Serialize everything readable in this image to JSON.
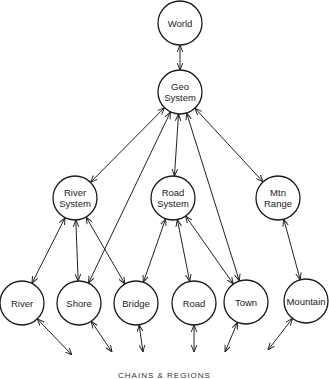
{
  "diagram": {
    "type": "hierarchy",
    "nodes": [
      {
        "id": "world",
        "lines": [
          "World"
        ],
        "x": 180,
        "y": 23
      },
      {
        "id": "geo",
        "lines": [
          "Geo",
          "System"
        ],
        "x": 180,
        "y": 92
      },
      {
        "id": "riversys",
        "lines": [
          "River",
          "System"
        ],
        "x": 75,
        "y": 198
      },
      {
        "id": "roadsys",
        "lines": [
          "Road",
          "System"
        ],
        "x": 173,
        "y": 198
      },
      {
        "id": "mtn",
        "lines": [
          "Mtn",
          "Range"
        ],
        "x": 278,
        "y": 198
      },
      {
        "id": "river",
        "lines": [
          "River"
        ],
        "x": 22,
        "y": 303
      },
      {
        "id": "shore",
        "lines": [
          "Shore"
        ],
        "x": 79,
        "y": 303
      },
      {
        "id": "bridge",
        "lines": [
          "Bridge"
        ],
        "x": 136,
        "y": 303
      },
      {
        "id": "road",
        "lines": [
          "Road"
        ],
        "x": 194,
        "y": 303
      },
      {
        "id": "town",
        "lines": [
          "Town"
        ],
        "x": 246,
        "y": 302
      },
      {
        "id": "mountain",
        "lines": [
          "Mountain"
        ],
        "x": 306,
        "y": 301
      }
    ],
    "edges": [
      {
        "from": "world",
        "to": "geo"
      },
      {
        "from": "geo",
        "to": "riversys"
      },
      {
        "from": "geo",
        "to": "roadsys"
      },
      {
        "from": "geo",
        "to": "mtn"
      },
      {
        "from": "geo",
        "to": "shore"
      },
      {
        "from": "geo",
        "to": "town"
      },
      {
        "from": "riversys",
        "to": "river"
      },
      {
        "from": "riversys",
        "to": "shore"
      },
      {
        "from": "riversys",
        "to": "bridge"
      },
      {
        "from": "roadsys",
        "to": "bridge"
      },
      {
        "from": "roadsys",
        "to": "road"
      },
      {
        "from": "roadsys",
        "to": "town"
      },
      {
        "from": "mtn",
        "to": "mountain"
      }
    ],
    "dangling": [
      {
        "from": "river",
        "x2": 72,
        "y2": 355
      },
      {
        "from": "shore",
        "x2": 112,
        "y2": 352
      },
      {
        "from": "bridge",
        "x2": 143,
        "y2": 352
      },
      {
        "from": "road",
        "x2": 194,
        "y2": 352
      },
      {
        "from": "town",
        "x2": 225,
        "y2": 352
      },
      {
        "from": "mountain",
        "x2": 268,
        "y2": 350
      }
    ],
    "caption": "CHAINS & REGIONS"
  }
}
